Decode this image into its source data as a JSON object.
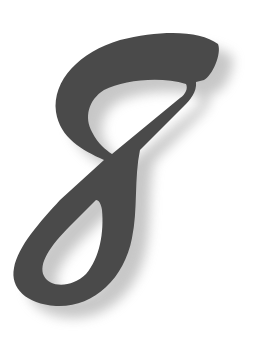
{
  "figure": {
    "glyph": "8",
    "icon": "numeral-eight-icon",
    "colors": {
      "fill": "#4a4a4a",
      "shadow": "#9a9a9a",
      "background": "#ffffff"
    }
  }
}
